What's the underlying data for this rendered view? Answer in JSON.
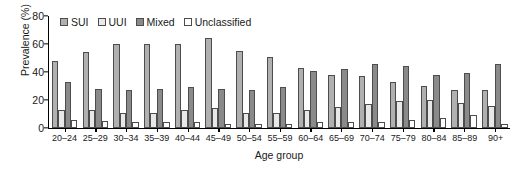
{
  "chart_data": {
    "type": "bar",
    "title": "",
    "xlabel": "Age group",
    "ylabel": "Prevalence (%)",
    "ylim": [
      0,
      80
    ],
    "yticks": [
      0,
      20,
      40,
      60,
      80
    ],
    "grid": false,
    "legend_position": "top-left-inside",
    "categories": [
      "20–24",
      "25–29",
      "30–34",
      "35–39",
      "40–44",
      "45–49",
      "50–54",
      "55–59",
      "60–64",
      "65–69",
      "70–74",
      "75–79",
      "80–84",
      "85–89",
      "90+"
    ],
    "series": [
      {
        "name": "SUI",
        "color": "#b0b0b0",
        "values": [
          48,
          54,
          60,
          60,
          60,
          64,
          55,
          51,
          43,
          38,
          37,
          33,
          30,
          27,
          27
        ]
      },
      {
        "name": "UUI",
        "color": "#e8e8e8",
        "values": [
          13,
          13,
          11,
          11,
          13,
          14,
          11,
          11,
          13,
          15,
          17,
          19,
          20,
          18,
          16
        ]
      },
      {
        "name": "Mixed",
        "color": "#8a8a8a",
        "values": [
          33,
          28,
          27,
          28,
          29,
          28,
          27,
          29,
          41,
          42,
          46,
          44,
          38,
          39,
          46
        ]
      },
      {
        "name": "Unclassified",
        "color": "#ffffff",
        "values": [
          6,
          5,
          4,
          4,
          4,
          3,
          3,
          3,
          4,
          4,
          4,
          6,
          7,
          9,
          3
        ]
      }
    ]
  },
  "legend": {
    "items": [
      {
        "label": "SUI"
      },
      {
        "label": "UUI"
      },
      {
        "label": "Mixed"
      },
      {
        "label": "Unclassified"
      }
    ]
  }
}
